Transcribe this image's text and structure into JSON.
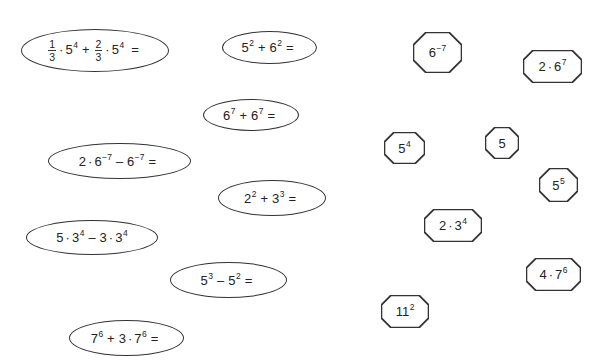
{
  "worksheet": {
    "expressions": [
      {
        "id": "e1",
        "text": "1/3·5^4 + 2/3·5^4 =",
        "parts": {
          "f1n": "1",
          "f1d": "3",
          "b1": "5",
          "p1": "4",
          "op": "+",
          "f2n": "2",
          "f2d": "3",
          "b2": "5",
          "p2": "4",
          "eq": "="
        }
      },
      {
        "id": "e2",
        "text": "5^2 + 6^2 =",
        "parts": {
          "b1": "5",
          "p1": "2",
          "op": "+",
          "b2": "6",
          "p2": "2",
          "eq": "="
        }
      },
      {
        "id": "e3",
        "text": "6^7 + 6^7 =",
        "parts": {
          "b1": "6",
          "p1": "7",
          "op": "+",
          "b2": "6",
          "p2": "7",
          "eq": "="
        }
      },
      {
        "id": "e4",
        "text": "2·6^-7 − 6^-7 =",
        "parts": {
          "c1": "2",
          "b1": "6",
          "p1": "−7",
          "op": "–",
          "b2": "6",
          "p2": "−7",
          "eq": "="
        }
      },
      {
        "id": "e5",
        "text": "2^2 + 3^3 =",
        "parts": {
          "b1": "2",
          "p1": "2",
          "op": "+",
          "b2": "3",
          "p2": "3",
          "eq": "="
        }
      },
      {
        "id": "e6",
        "text": "5·3^4 − 3·3^4",
        "parts": {
          "c1": "5",
          "b1": "3",
          "p1": "4",
          "op": "–",
          "c2": "3",
          "b2": "3",
          "p2": "4"
        }
      },
      {
        "id": "e7",
        "text": "5^3 − 5^2 =",
        "parts": {
          "b1": "5",
          "p1": "3",
          "op": "–",
          "b2": "5",
          "p2": "2",
          "eq": "="
        }
      },
      {
        "id": "e8",
        "text": "7^6 + 3·7^6 =",
        "parts": {
          "b1": "7",
          "p1": "6",
          "op": "+",
          "c2": "3",
          "b2": "7",
          "p2": "6",
          "eq": "="
        }
      }
    ],
    "answers": [
      {
        "id": "a1",
        "text": "6^-7",
        "parts": {
          "b": "6",
          "p": "−7"
        }
      },
      {
        "id": "a2",
        "text": "2·6^7",
        "parts": {
          "c": "2",
          "b": "6",
          "p": "7"
        }
      },
      {
        "id": "a3",
        "text": "5^4",
        "parts": {
          "b": "5",
          "p": "4"
        }
      },
      {
        "id": "a4",
        "text": "5",
        "parts": {
          "b": "5"
        }
      },
      {
        "id": "a5",
        "text": "5^5",
        "parts": {
          "b": "5",
          "p": "5"
        }
      },
      {
        "id": "a6",
        "text": "2·3^4",
        "parts": {
          "c": "2",
          "b": "3",
          "p": "4"
        }
      },
      {
        "id": "a7",
        "text": "4·7^6",
        "parts": {
          "c": "4",
          "b": "7",
          "p": "6"
        }
      },
      {
        "id": "a8",
        "text": "11^2",
        "parts": {
          "b": "11",
          "p": "2"
        }
      }
    ],
    "symbols": {
      "dot": "·"
    }
  }
}
